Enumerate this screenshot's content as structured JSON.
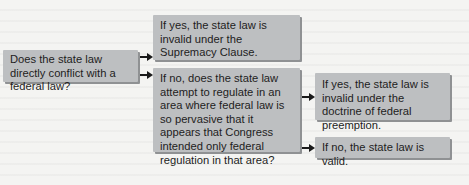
{
  "diagram": {
    "question": "Does the state law directly conflict with a federal law?",
    "yes_branch": "If yes, the state law is invalid under the Supremacy Clause.",
    "no_branch": "If no, does the state law attempt to regulate in an area where federal law is so pervasive that it appears that Congress intended only federal regulation in that area?",
    "preemption_yes": "If yes, the state law is invalid under the doctrine of federal preemption.",
    "preemption_no": "If no, the state law is valid."
  },
  "colors": {
    "box_fill": "#bdbfc1",
    "box_shadow": "#8f9193",
    "text": "#1d1d1d",
    "arrow": "#1a1a1a",
    "background": "#f4f4f2"
  }
}
